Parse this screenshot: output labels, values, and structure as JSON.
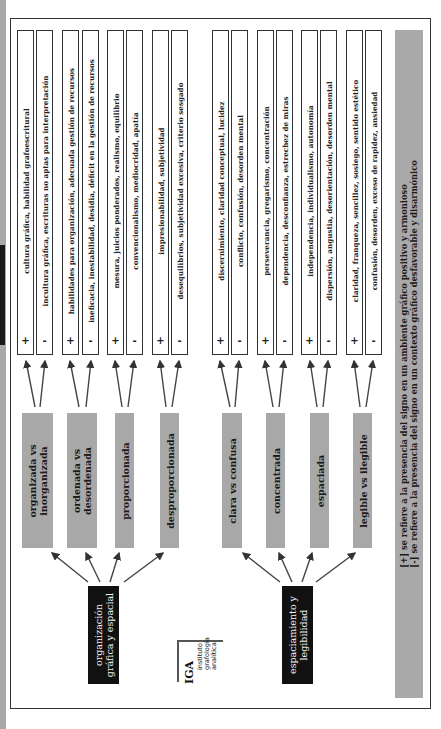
{
  "legend": {
    "plus_line": "[+]  se refiere a la presencia del signo en un ambiente gráfico positivo y armonioso",
    "minus_line": "[-]  se refiere a la presencia del signo en un contexto gráfico desfavorable y disarmónico"
  },
  "logo": {
    "mark": "IGA",
    "line1": "instituto",
    "line2": "grafología",
    "line3": "analítica"
  },
  "roots": [
    {
      "line1": "organización",
      "line2": "gráfica y espacial"
    },
    {
      "line1": "espaciamiento y",
      "line2": "legibilidad"
    }
  ],
  "categories": [
    {
      "line1": "organizada vs",
      "line2": "inorganizada"
    },
    {
      "line1": "ordenada vs",
      "line2": "desordenada"
    },
    {
      "line1": "proporcionada",
      "line2": ""
    },
    {
      "line1": "desproporcionada",
      "line2": ""
    },
    {
      "line1": "clara vs confusa",
      "line2": ""
    },
    {
      "line1": "concentrada",
      "line2": ""
    },
    {
      "line1": "espaciada",
      "line2": ""
    },
    {
      "line1": "legible vs ilegible",
      "line2": ""
    }
  ],
  "traits": [
    {
      "sign": "+",
      "text": "cultura gráfica, habilidad grafoescritural"
    },
    {
      "sign": "-",
      "text": "incultura gráfica, escrituras no aptas para interpretación"
    },
    {
      "sign": "+",
      "text": "habilidades para organización, adecuada gestión de recursos"
    },
    {
      "sign": "-",
      "text": "ineficacia, inestabilidad, desidia, déficit en la gestión de recursos"
    },
    {
      "sign": "+",
      "text": "mesura, juicios ponderados, realismo, equilibrio"
    },
    {
      "sign": "-",
      "text": "convencionalismo, mediocridad, apatía"
    },
    {
      "sign": "+",
      "text": "impresionabilidad, subjetividad"
    },
    {
      "sign": "-",
      "text": "desequilibrios, subjetividad excesiva, criterio sesgado"
    },
    {
      "sign": "+",
      "text": "discernimiento, claridad conceptual, lucidez"
    },
    {
      "sign": "-",
      "text": "conflicto, confusión, desorden mental"
    },
    {
      "sign": "+",
      "text": "perseverancia, gregarismo, concentración"
    },
    {
      "sign": "-",
      "text": "dependencia, desconfianza, estrechez de miras"
    },
    {
      "sign": "+",
      "text": "independencia, individualismo, autonomía"
    },
    {
      "sign": "-",
      "text": "dispersión, angustia, desorientación, desorden mental"
    },
    {
      "sign": "+",
      "text": "claridad, franqueza, sencillez, sosiego, sentido estético"
    },
    {
      "sign": "-",
      "text": "confusión, desorden, exceso de rapidez, ansiedad"
    }
  ],
  "colors": {
    "root_box": "#111111",
    "category_box": "#a8a8a8",
    "legend_box": "#a9a9a9",
    "border": "#333333"
  }
}
